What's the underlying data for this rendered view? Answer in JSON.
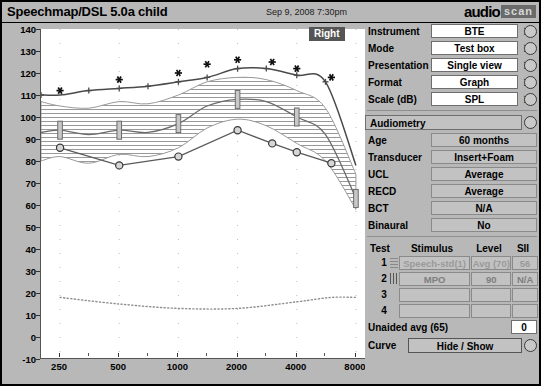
{
  "window": {
    "title": "Speechmap/DSL 5.0a child",
    "date": "Sep 9, 2008 7:30pm",
    "logo_primary": "audio",
    "logo_secondary": "scan",
    "ear_badge": "Right"
  },
  "settings": {
    "rows": [
      {
        "label": "Instrument",
        "value": "BTE"
      },
      {
        "label": "Mode",
        "value": "Test box"
      },
      {
        "label": "Presentation",
        "value": "Single view"
      },
      {
        "label": "Format",
        "value": "Graph"
      },
      {
        "label": "Scale (dB)",
        "value": "SPL"
      }
    ]
  },
  "audiometry": {
    "header": "Audiometry",
    "rows": [
      {
        "label": "Age",
        "value": "60 months"
      },
      {
        "label": "Transducer",
        "value": "Insert+Foam"
      },
      {
        "label": "UCL",
        "value": "Average"
      },
      {
        "label": "RECD",
        "value": "Average"
      },
      {
        "label": "BCT",
        "value": "N/A"
      },
      {
        "label": "Binaural",
        "value": "No"
      }
    ]
  },
  "test_table": {
    "headers": [
      "Test",
      "Stimulus",
      "Level",
      "SII"
    ],
    "rows": [
      {
        "num": "1",
        "stimulus": "Speech-std(1)",
        "level": "Avg (70)",
        "sii": "56"
      },
      {
        "num": "2",
        "stimulus": "MPO",
        "level": "90",
        "sii": "N/A"
      },
      {
        "num": "3",
        "stimulus": "",
        "level": "",
        "sii": ""
      },
      {
        "num": "4",
        "stimulus": "",
        "level": "",
        "sii": ""
      }
    ],
    "unaided_label": "Unaided avg (65)",
    "unaided_value": "0",
    "curve_label": "Curve",
    "curve_button": "Hide / Show"
  },
  "chart_data": {
    "type": "line",
    "title": "Speechmap/DSL 5.0a child",
    "xlabel": "",
    "ylabel": "",
    "xscale": "log",
    "xlim": [
      200,
      9000
    ],
    "ylim": [
      -10,
      140
    ],
    "xticks": [
      250,
      500,
      1000,
      2000,
      4000,
      8000
    ],
    "xticklabels": [
      "250",
      "500",
      "1000",
      "2000",
      "4000",
      "8000"
    ],
    "yticks": [
      -10,
      0,
      10,
      20,
      30,
      40,
      50,
      60,
      70,
      80,
      90,
      100,
      110,
      120,
      130,
      140
    ],
    "grid": "dotted-vertical",
    "legend": "none",
    "series": [
      {
        "name": "UCL (asterisk markers)",
        "marker": "asterisk",
        "x": [
          250,
          500,
          1000,
          1400,
          2000,
          3000,
          4000,
          6000
        ],
        "values": [
          112,
          117,
          120,
          124,
          126,
          125,
          122,
          118
        ]
      },
      {
        "name": "MPO / Test 2 (crosses)",
        "marker": "plus",
        "x": [
          200,
          250,
          350,
          500,
          700,
          1000,
          1400,
          2000,
          2800,
          4000,
          5600,
          8000
        ],
        "values": [
          110,
          110,
          112,
          113,
          114,
          116,
          118,
          122,
          122,
          119,
          116,
          78
        ]
      },
      {
        "name": "Aided speech LTASS (I-beam markers)",
        "marker": "ibeam",
        "x": [
          200,
          250,
          350,
          500,
          700,
          1000,
          1400,
          2000,
          2800,
          4000,
          5600,
          8000
        ],
        "values": [
          93,
          94,
          92,
          94,
          93,
          97,
          105,
          108,
          107,
          100,
          92,
          63
        ]
      },
      {
        "name": "Thresholds (circle markers)",
        "marker": "circle",
        "x": [
          250,
          500,
          1000,
          2000,
          3000,
          4000,
          6000
        ],
        "values": [
          86,
          78,
          82,
          94,
          88,
          84,
          79
        ]
      },
      {
        "name": "Noise floor",
        "marker": "dotted",
        "x": [
          250,
          500,
          1000,
          2000,
          4000,
          6000,
          8000
        ],
        "values": [
          18,
          15,
          13,
          13,
          16,
          18,
          18
        ]
      }
    ],
    "regions": [
      {
        "name": "Speech banana (hatched)",
        "x": [
          200,
          250,
          350,
          500,
          700,
          1000,
          1400,
          2000,
          2800,
          4000,
          5600,
          8000
        ],
        "upper": [
          107,
          105,
          104,
          107,
          106,
          110,
          116,
          118,
          117,
          112,
          104,
          74
        ],
        "lower": [
          80,
          82,
          79,
          83,
          82,
          86,
          95,
          99,
          96,
          88,
          80,
          58
        ]
      }
    ]
  }
}
